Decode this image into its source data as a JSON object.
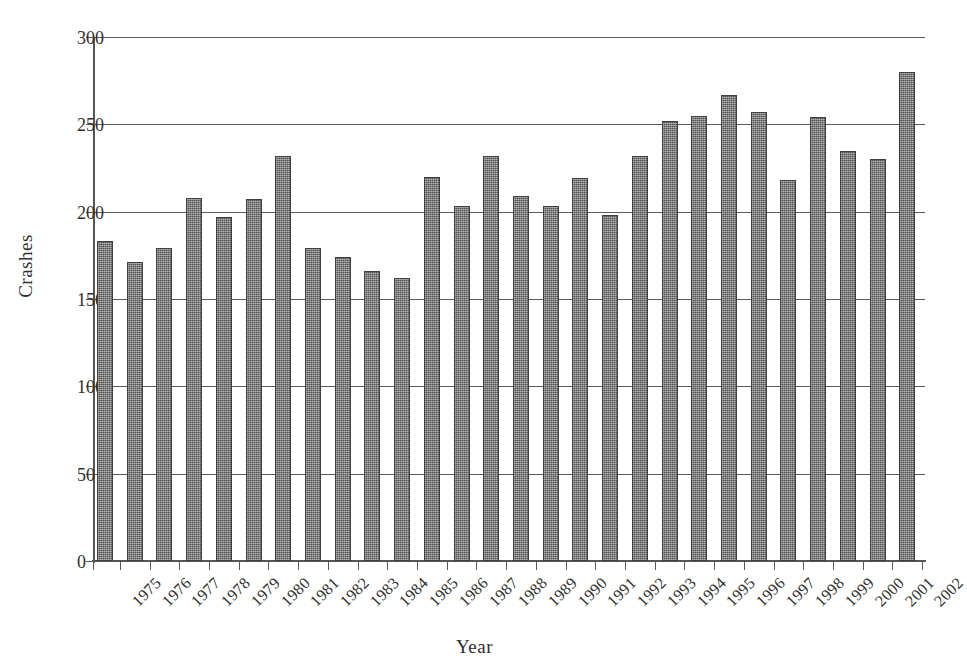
{
  "chart_data": {
    "type": "bar",
    "title": "",
    "xlabel": "Year",
    "ylabel": "Crashes",
    "categories": [
      "1975",
      "1976",
      "1977",
      "1978",
      "1979",
      "1980",
      "1981",
      "1982",
      "1983",
      "1984",
      "1985",
      "1986",
      "1987",
      "1988",
      "1989",
      "1990",
      "1991",
      "1992",
      "1993",
      "1994",
      "1995",
      "1996",
      "1997",
      "1998",
      "1999",
      "2000",
      "2001",
      "2002"
    ],
    "values": [
      183,
      171,
      179,
      208,
      197,
      207,
      232,
      179,
      174,
      166,
      162,
      220,
      203,
      232,
      209,
      203,
      219,
      198,
      232,
      252,
      255,
      267,
      257,
      218,
      254,
      235,
      230,
      280
    ],
    "ylim": [
      0,
      300
    ],
    "yticks": [
      0,
      50,
      100,
      150,
      200,
      250,
      300
    ],
    "ytick_labels": [
      "0",
      "50",
      "100",
      "150",
      "200",
      "250",
      "300"
    ],
    "grid": true,
    "legend": "none",
    "series": [
      {
        "name": "Crashes",
        "color": "#6f6f6f"
      }
    ]
  },
  "style": {
    "bar_fill": "#6f6f6f",
    "bar_border": "#3f3f3f",
    "axis_color": "#555555",
    "grid_color": "#5a5a5a",
    "text_color": "#2f2f2f",
    "background": "#ffffff"
  }
}
